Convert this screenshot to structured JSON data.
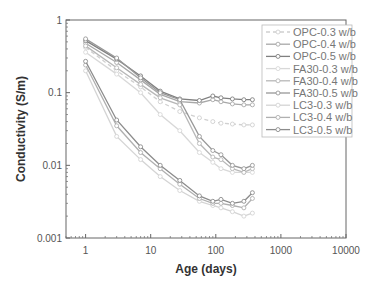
{
  "chart_data": {
    "type": "line",
    "title": "",
    "xlabel": "Age (days)",
    "ylabel": "Conductivity (S/m)",
    "xscale": "log",
    "yscale": "log",
    "xlim": [
      0.5,
      10000
    ],
    "ylim": [
      0.001,
      1
    ],
    "x_ticks": [
      "1",
      "10",
      "100",
      "1000",
      "10000"
    ],
    "y_ticks": [
      "0.001",
      "0.01",
      "0.1",
      "1"
    ],
    "grid": false,
    "legend_position": "upper right",
    "x": [
      1,
      3,
      7,
      14,
      28,
      56,
      90,
      120,
      180,
      270,
      365
    ],
    "series": [
      {
        "name": "OPC-0.3 w/b",
        "color": "#d0d0d0",
        "dash": "4,3",
        "values": [
          0.42,
          0.2,
          0.12,
          0.075,
          0.055,
          0.045,
          0.04,
          0.038,
          0.037,
          0.036,
          0.036
        ]
      },
      {
        "name": "OPC-0.4 w/b",
        "color": "#a8a8a8",
        "dash": "",
        "values": [
          0.48,
          0.26,
          0.15,
          0.095,
          0.075,
          0.072,
          0.08,
          0.075,
          0.07,
          0.068,
          0.068
        ]
      },
      {
        "name": "OPC-0.5 w/b",
        "color": "#808080",
        "dash": "",
        "values": [
          0.52,
          0.29,
          0.17,
          0.105,
          0.082,
          0.078,
          0.09,
          0.085,
          0.082,
          0.08,
          0.08
        ]
      },
      {
        "name": "FA30-0.3 w/b",
        "color": "#d8d8d8",
        "dash": "",
        "values": [
          0.36,
          0.18,
          0.1,
          0.05,
          0.03,
          0.015,
          0.011,
          0.009,
          0.008,
          0.008,
          0.008
        ]
      },
      {
        "name": "FA30-0.4 w/b",
        "color": "#b8b8b8",
        "dash": "",
        "values": [
          0.44,
          0.22,
          0.13,
          0.085,
          0.068,
          0.02,
          0.013,
          0.012,
          0.009,
          0.008,
          0.009
        ]
      },
      {
        "name": "FA30-0.5 w/b",
        "color": "#989898",
        "dash": "",
        "values": [
          0.55,
          0.3,
          0.16,
          0.1,
          0.08,
          0.025,
          0.016,
          0.014,
          0.01,
          0.009,
          0.01
        ]
      },
      {
        "name": "LC3-0.3 w/b",
        "color": "#d4d4d4",
        "dash": "",
        "values": [
          0.2,
          0.025,
          0.012,
          0.007,
          0.0045,
          0.0032,
          0.0028,
          0.0026,
          0.0023,
          0.002,
          0.0022
        ]
      },
      {
        "name": "LC3-0.4 w/b",
        "color": "#b0b0b0",
        "dash": "",
        "values": [
          0.24,
          0.035,
          0.015,
          0.009,
          0.0055,
          0.0035,
          0.003,
          0.003,
          0.0028,
          0.0026,
          0.0035
        ]
      },
      {
        "name": "LC3-0.5 w/b",
        "color": "#8c8c8c",
        "dash": "",
        "values": [
          0.27,
          0.042,
          0.018,
          0.01,
          0.0062,
          0.0038,
          0.0032,
          0.0034,
          0.003,
          0.0032,
          0.0042
        ]
      }
    ]
  },
  "axes": {
    "x_title": "Age (days)",
    "y_title": "Conductivity (S/m)",
    "x_tick_labels": [
      "1",
      "10",
      "100",
      "1000",
      "10000"
    ],
    "y_tick_labels": [
      "0.001",
      "0.01",
      "0.1",
      "1"
    ]
  },
  "legend": {
    "items": [
      "OPC-0.3 w/b",
      "OPC-0.4 w/b",
      "OPC-0.5 w/b",
      "FA30-0.3 w/b",
      "FA30-0.4 w/b",
      "FA30-0.5 w/b",
      "LC3-0.3 w/b",
      "LC3-0.4 w/b",
      "LC3-0.5 w/b"
    ]
  },
  "colors": {
    "axis": "#555555",
    "background": "#ffffff",
    "legend_border": "#bbbbbb"
  }
}
